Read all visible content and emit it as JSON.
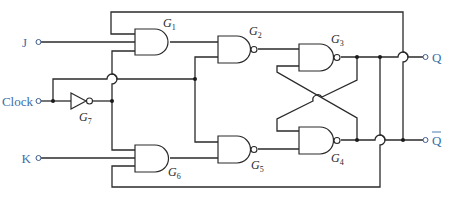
{
  "diagram": {
    "inputs": [
      {
        "id": "J",
        "label": "J"
      },
      {
        "id": "Clock",
        "label": "Clock"
      },
      {
        "id": "K",
        "label": "K"
      }
    ],
    "outputs": [
      {
        "id": "Q",
        "label": "Q"
      },
      {
        "id": "Qbar",
        "label": "Q",
        "overline": true
      }
    ],
    "gates": [
      {
        "id": "G1",
        "letter": "G",
        "sub": "1",
        "type": "AND"
      },
      {
        "id": "G2",
        "letter": "G",
        "sub": "2",
        "type": "NAND"
      },
      {
        "id": "G3",
        "letter": "G",
        "sub": "3",
        "type": "NAND"
      },
      {
        "id": "G4",
        "letter": "G",
        "sub": "4",
        "type": "NAND"
      },
      {
        "id": "G5",
        "letter": "G",
        "sub": "5",
        "type": "NAND"
      },
      {
        "id": "G6",
        "letter": "G",
        "sub": "6",
        "type": "AND"
      },
      {
        "id": "G7",
        "letter": "G",
        "sub": "7",
        "type": "NOT"
      }
    ],
    "colors": {
      "wire": "#2a2a2a",
      "label": "#3a6ea8"
    }
  }
}
